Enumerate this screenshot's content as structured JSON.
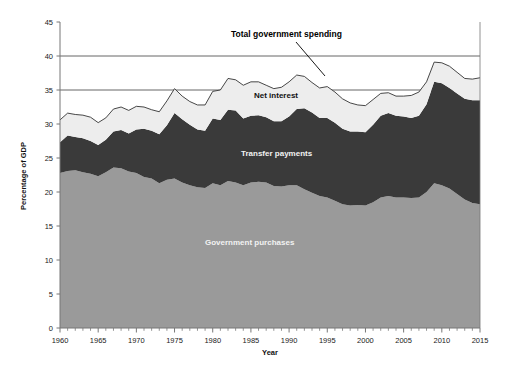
{
  "chart_data": {
    "type": "area",
    "stacked": true,
    "title": "",
    "xlabel": "Year",
    "ylabel": "Percentage of GDP",
    "xlim": [
      1960,
      2015
    ],
    "ylim": [
      0,
      45
    ],
    "ytick_step": 5,
    "xtick_step": 5,
    "xticks": [
      1960,
      1965,
      1970,
      1975,
      1980,
      1985,
      1990,
      1995,
      2000,
      2005,
      2010,
      2015
    ],
    "yticks": [
      0,
      5,
      10,
      15,
      20,
      25,
      30,
      35,
      40,
      45
    ],
    "xminor_tick_step": 1,
    "grid": "horizontal-partial",
    "gridlines": [
      35,
      40
    ],
    "legend_position": "inline-annotations",
    "colors": {
      "government_purchases": "#9a9a9a",
      "transfer_payments": "#3a3a3a",
      "net_interest": "#ededed",
      "total_line": "#333333",
      "gridline": "#555555",
      "axis": "#666666"
    },
    "annotations": [
      {
        "name": "total-government-spending",
        "text": "Total government spending",
        "x_px": 231,
        "y_px": 37,
        "leader_from_px": [
          296,
          42
        ],
        "leader_to_px": [
          325,
          76
        ]
      },
      {
        "name": "net-interest",
        "text": "Net interest",
        "x_px": 254,
        "y_px": 98
      },
      {
        "name": "transfer-payments",
        "text": "Transfer payments",
        "x_px": 241,
        "y_px": 156
      },
      {
        "name": "government-purchases",
        "text": "Government purchases",
        "x_px": 205,
        "y_px": 245
      }
    ],
    "x": [
      1960,
      1961,
      1962,
      1963,
      1964,
      1965,
      1966,
      1967,
      1968,
      1969,
      1970,
      1971,
      1972,
      1973,
      1974,
      1975,
      1976,
      1977,
      1978,
      1979,
      1980,
      1981,
      1982,
      1983,
      1984,
      1985,
      1986,
      1987,
      1988,
      1989,
      1990,
      1991,
      1992,
      1993,
      1994,
      1995,
      1996,
      1997,
      1998,
      1999,
      2000,
      2001,
      2002,
      2003,
      2004,
      2005,
      2006,
      2007,
      2008,
      2009,
      2010,
      2011,
      2012,
      2013,
      2014,
      2015
    ],
    "series": [
      {
        "name": "Government purchases",
        "key": "government_purchases",
        "color": "#9a9a9a",
        "values": [
          22.8,
          23.1,
          23.2,
          22.9,
          22.7,
          22.3,
          22.9,
          23.6,
          23.5,
          23.0,
          22.8,
          22.2,
          22.0,
          21.3,
          21.8,
          22.0,
          21.4,
          21.0,
          20.7,
          20.6,
          21.3,
          21.0,
          21.6,
          21.4,
          21.0,
          21.4,
          21.5,
          21.4,
          20.9,
          20.8,
          21.0,
          21.0,
          20.4,
          19.9,
          19.4,
          19.2,
          18.7,
          18.2,
          18.0,
          18.1,
          18.0,
          18.5,
          19.2,
          19.4,
          19.2,
          19.2,
          19.1,
          19.2,
          20.0,
          21.3,
          21.0,
          20.5,
          19.7,
          18.9,
          18.4,
          18.2
        ]
      },
      {
        "name": "Transfer payments",
        "key": "transfer_payments",
        "color": "#3a3a3a",
        "values": [
          4.5,
          5.2,
          4.9,
          5.0,
          4.8,
          4.6,
          4.8,
          5.3,
          5.6,
          5.6,
          6.4,
          7.1,
          7.0,
          7.2,
          8.0,
          9.6,
          9.3,
          8.9,
          8.5,
          8.4,
          9.5,
          9.6,
          10.5,
          10.6,
          9.8,
          9.8,
          9.8,
          9.6,
          9.5,
          9.6,
          10.1,
          11.2,
          11.9,
          11.8,
          11.5,
          11.7,
          11.5,
          11.1,
          10.9,
          10.8,
          10.8,
          11.4,
          12.0,
          12.2,
          12.0,
          11.9,
          11.8,
          12.0,
          12.9,
          14.9,
          15.0,
          14.8,
          14.8,
          14.8,
          15.1,
          15.3
        ]
      },
      {
        "name": "Net interest",
        "key": "net_interest",
        "color": "#ededed",
        "values": [
          3.3,
          3.3,
          3.3,
          3.4,
          3.5,
          3.3,
          3.2,
          3.3,
          3.4,
          3.4,
          3.4,
          3.2,
          3.1,
          3.3,
          3.6,
          3.6,
          3.4,
          3.4,
          3.6,
          3.8,
          4.0,
          4.4,
          4.6,
          4.5,
          4.9,
          5.0,
          4.9,
          4.7,
          4.8,
          5.0,
          5.1,
          5.0,
          4.7,
          4.4,
          4.4,
          4.6,
          4.5,
          4.4,
          4.2,
          3.9,
          3.9,
          3.7,
          3.3,
          3.0,
          2.9,
          3.0,
          3.3,
          3.5,
          3.3,
          2.9,
          3.0,
          3.2,
          3.1,
          3.0,
          3.1,
          3.3
        ]
      }
    ],
    "total_series": {
      "name": "Total government spending",
      "values": [
        30.6,
        31.6,
        31.4,
        31.3,
        31.0,
        30.2,
        30.9,
        32.2,
        32.5,
        32.0,
        32.6,
        32.5,
        32.1,
        31.8,
        33.4,
        35.2,
        34.1,
        33.3,
        32.8,
        32.8,
        34.8,
        35.0,
        36.7,
        36.5,
        35.7,
        36.2,
        36.2,
        35.7,
        35.2,
        35.4,
        36.2,
        37.2,
        37.0,
        36.1,
        35.3,
        35.5,
        34.7,
        33.7,
        33.1,
        32.8,
        32.7,
        33.6,
        34.5,
        34.6,
        34.1,
        34.1,
        34.2,
        34.7,
        36.2,
        39.1,
        39.0,
        38.5,
        37.6,
        36.7,
        36.6,
        36.8
      ]
    }
  },
  "axis": {
    "y_title": "Percentage of GDP",
    "x_title": "Year"
  }
}
